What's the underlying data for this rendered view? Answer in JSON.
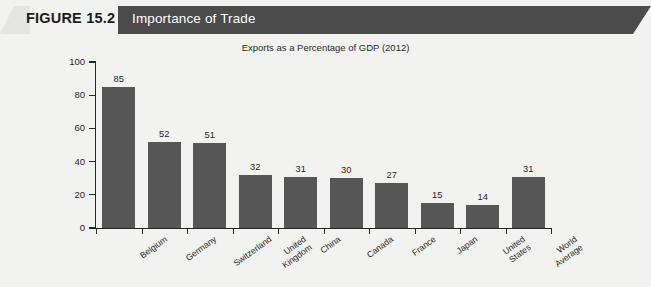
{
  "header": {
    "figure_number": "FIGURE 15.2",
    "title": "Importance of Trade",
    "banner_color": "#4b4b4b"
  },
  "chart_data": {
    "type": "bar",
    "title": "Exports as a Percentage of GDP (2012)",
    "subtitle": "Exports as a Percentage of GDP (2012)",
    "xlabel": "",
    "ylabel": "",
    "ylim": [
      0,
      100
    ],
    "yticks": [
      0,
      20,
      40,
      60,
      80,
      100
    ],
    "ytick_labels": [
      "0",
      "20",
      "40",
      "60",
      "80",
      "100"
    ],
    "grid": false,
    "legend": false,
    "bar_color": "#565656",
    "categories": [
      "Belgium",
      "Germany",
      "Switzerland",
      "United Kingdom",
      "China",
      "Canada",
      "France",
      "Japan",
      "United States",
      "World Average"
    ],
    "category_lines": [
      [
        "Belgium"
      ],
      [
        "Germany"
      ],
      [
        "Switzerland"
      ],
      [
        "United",
        "Kingdom"
      ],
      [
        "China"
      ],
      [
        "Canada"
      ],
      [
        "France"
      ],
      [
        "Japan"
      ],
      [
        "United",
        "States"
      ],
      [
        "World",
        "Average"
      ]
    ],
    "values": [
      85,
      52,
      51,
      32,
      31,
      30,
      27,
      15,
      14,
      31
    ],
    "value_labels": [
      "85",
      "52",
      "51",
      "32",
      "31",
      "30",
      "27",
      "15",
      "14",
      "31"
    ]
  }
}
